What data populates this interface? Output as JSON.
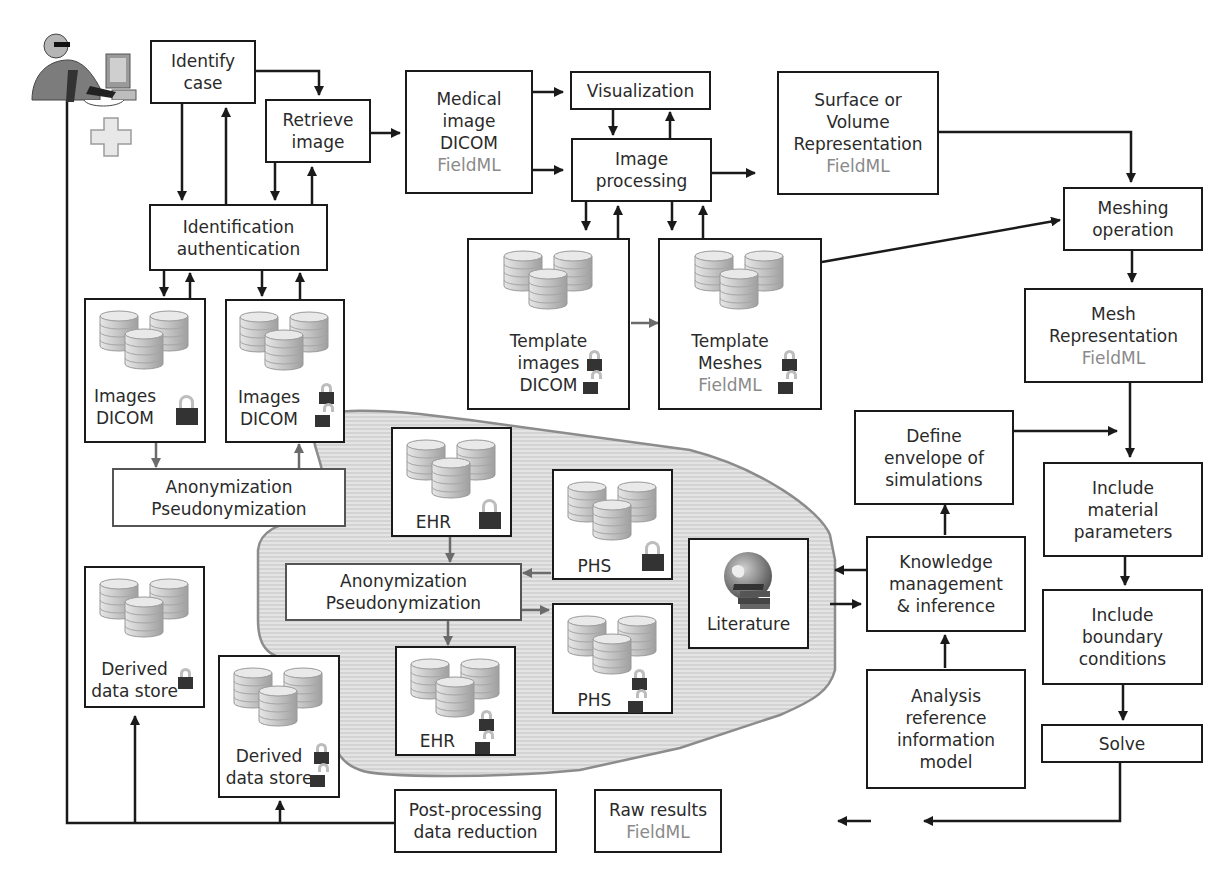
{
  "diagram": {
    "format_label": "FieldML",
    "colors": {
      "line": "#1a1a1a",
      "grey_line": "#6b6b6b",
      "format_text": "#8a8a8a",
      "lock": "#333333",
      "blob_fill": "#d9d9d9",
      "blob_stroke": "#8c8c8c",
      "db_fill": "#cfcfcf"
    },
    "actor": {
      "icon": "clinician-at-computer-icon",
      "badge": "medical-cross-icon"
    },
    "boxes": {
      "identify_case": {
        "lines": [
          "Identify",
          "case"
        ]
      },
      "retrieve_image": {
        "lines": [
          "Retrieve",
          "image"
        ]
      },
      "medical_image": {
        "lines": [
          "Medical",
          "image",
          "DICOM"
        ],
        "format": "FieldML"
      },
      "visualization": {
        "lines": [
          "Visualization"
        ]
      },
      "image_processing": {
        "lines": [
          "Image",
          "processing"
        ]
      },
      "surface_volume": {
        "lines": [
          "Surface or",
          "Volume",
          "Representation"
        ],
        "format": "FieldML"
      },
      "identification_auth": {
        "lines": [
          "Identification",
          "authentication"
        ]
      },
      "meshing_operation": {
        "lines": [
          "Meshing",
          "operation"
        ]
      },
      "mesh_representation": {
        "lines": [
          "Mesh",
          "Representation"
        ],
        "format": "FieldML"
      },
      "anon_top": {
        "lines": [
          "Anonymization",
          "Pseudonymization"
        ]
      },
      "anon_center": {
        "lines": [
          "Anonymization",
          "Pseudonymization"
        ]
      },
      "define_envelope": {
        "lines": [
          "Define",
          "envelope of",
          "simulations"
        ]
      },
      "include_material": {
        "lines": [
          "Include",
          "material",
          "parameters"
        ]
      },
      "knowledge_mgmt": {
        "lines": [
          "Knowledge",
          "management",
          "& inference"
        ]
      },
      "include_boundary": {
        "lines": [
          "Include",
          "boundary",
          "conditions"
        ]
      },
      "analysis_rim": {
        "lines": [
          "Analysis",
          "reference",
          "information",
          "model"
        ]
      },
      "solve": {
        "lines": [
          "Solve"
        ]
      },
      "post_processing": {
        "lines": [
          "Post-processing",
          "data reduction"
        ]
      },
      "raw_results": {
        "lines": [
          "Raw results"
        ],
        "format": "FieldML"
      },
      "literature": {
        "label": "Literature",
        "icon": "globe-books-icon"
      }
    },
    "stores": {
      "images_dicom_locked": {
        "lines": [
          "Images",
          "DICOM"
        ],
        "locks": [
          "locked"
        ]
      },
      "images_dicom_mixed": {
        "lines": [
          "Images",
          "DICOM"
        ],
        "locks": [
          "locked",
          "unlocked"
        ]
      },
      "template_images": {
        "lines": [
          "Template",
          "images",
          "DICOM"
        ],
        "locks": [
          "locked",
          "unlocked"
        ]
      },
      "template_meshes": {
        "lines": [
          "Template",
          "Meshes"
        ],
        "format": "FieldML",
        "locks": [
          "locked",
          "unlocked"
        ]
      },
      "ehr_locked": {
        "lines": [
          "EHR"
        ],
        "locks": [
          "locked"
        ]
      },
      "phs_locked": {
        "lines": [
          "PHS"
        ],
        "locks": [
          "locked"
        ]
      },
      "ehr_mixed": {
        "lines": [
          "EHR"
        ],
        "locks": [
          "locked",
          "unlocked"
        ]
      },
      "phs_mixed": {
        "lines": [
          "PHS"
        ],
        "locks": [
          "locked",
          "unlocked"
        ]
      },
      "derived_locked": {
        "lines": [
          "Derived",
          "data store"
        ],
        "locks": [
          "locked"
        ]
      },
      "derived_mixed": {
        "lines": [
          "Derived",
          "data store"
        ],
        "locks": [
          "locked",
          "unlocked"
        ]
      }
    }
  }
}
